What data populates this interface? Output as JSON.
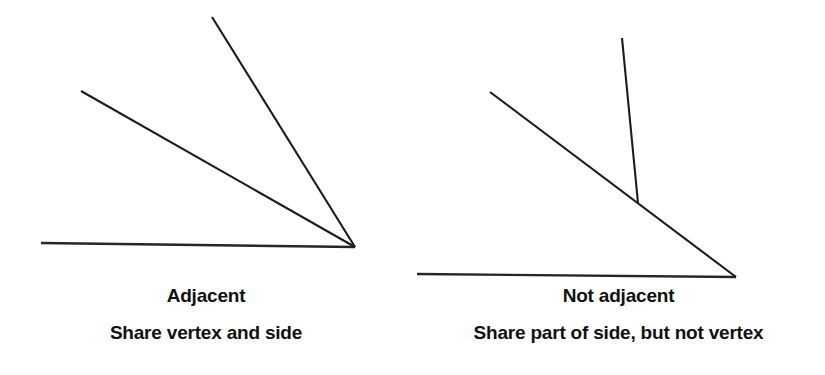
{
  "figure": {
    "background_color": "#ffffff",
    "stroke_color": "#1b1b1b",
    "text_color": "#111111"
  },
  "panels": [
    {
      "id": "adjacent",
      "title": "Adjacent",
      "subtitle": "Share vertex and side",
      "geometry": {
        "vertex": [
          355,
          247
        ],
        "rays": [
          {
            "name": "horizontal-base-ray",
            "from": [
              41,
              243
            ],
            "to": [
              355,
              247
            ]
          },
          {
            "name": "middle-ray",
            "from": [
              81,
              91
            ],
            "to": [
              355,
              247
            ]
          },
          {
            "name": "steep-ray",
            "from": [
              212,
              17
            ],
            "to": [
              355,
              247
            ]
          }
        ]
      }
    },
    {
      "id": "not-adjacent",
      "title": "Not adjacent",
      "subtitle": "Share part of side, but not vertex",
      "geometry": {
        "vertex": [
          736,
          277
        ],
        "junction": [
          638,
          203
        ],
        "rays": [
          {
            "name": "horizontal-base-ray",
            "from": [
              417,
              274
            ],
            "to": [
              736,
              277
            ]
          },
          {
            "name": "diagonal-ray",
            "from": [
              490,
              92
            ],
            "to": [
              736,
              277
            ]
          },
          {
            "name": "near-vertical-ray",
            "from": [
              622,
              38
            ],
            "to": [
              638,
              203
            ]
          }
        ]
      }
    }
  ]
}
